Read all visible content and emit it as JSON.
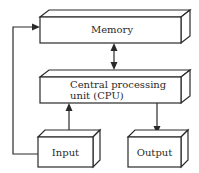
{
  "diagram": {
    "type": "block-diagram",
    "nodes": [
      {
        "id": "memory",
        "label": "Memory"
      },
      {
        "id": "cpu",
        "label_line1": "Central processing",
        "label_line2": "unit (CPU)"
      },
      {
        "id": "input",
        "label": "Input"
      },
      {
        "id": "output",
        "label": "Output"
      }
    ],
    "edges": [
      {
        "from": "memory",
        "to": "cpu",
        "bidirectional": true
      },
      {
        "from": "input",
        "to": "cpu",
        "bidirectional": false
      },
      {
        "from": "cpu",
        "to": "output",
        "bidirectional": false
      },
      {
        "from": "input",
        "to": "memory",
        "bidirectional": false
      }
    ]
  },
  "labels": {
    "memory": "Memory",
    "cpu_line1": "Central processing",
    "cpu_line2": "unit (CPU)",
    "input": "Input",
    "output": "Output"
  }
}
